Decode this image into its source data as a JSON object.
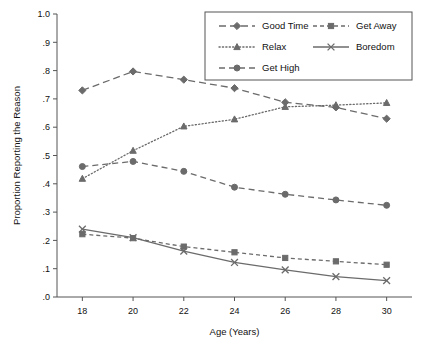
{
  "chart_data": {
    "type": "line",
    "title": "",
    "xlabel": "Age (Years)",
    "ylabel": "Proportion Reporting the Reason",
    "x": [
      18,
      20,
      22,
      24,
      26,
      28,
      30
    ],
    "xtick_labels": [
      "18",
      "20",
      "22",
      "24",
      "26",
      "28",
      "30"
    ],
    "ytick_labels": [
      "1.0",
      ".9",
      ".8",
      ".7",
      ".6",
      ".5",
      ".4",
      ".3",
      ".2",
      ".1",
      ".0"
    ],
    "ytick_values": [
      1.0,
      0.9,
      0.8,
      0.7,
      0.6,
      0.5,
      0.4,
      0.3,
      0.2,
      0.1,
      0.0
    ],
    "xlim": [
      17,
      31
    ],
    "ylim": [
      0.0,
      1.0
    ],
    "grid": false,
    "legend_position": "top-right",
    "series": [
      {
        "name": "Good Time",
        "marker": "diamond",
        "dash": "long-dash",
        "values": [
          0.73,
          0.797,
          0.768,
          0.738,
          0.688,
          0.67,
          0.63
        ]
      },
      {
        "name": "Get Away",
        "marker": "square",
        "dash": "short-dash",
        "values": [
          0.222,
          0.208,
          0.178,
          0.158,
          0.138,
          0.126,
          0.114
        ]
      },
      {
        "name": "Relax",
        "marker": "triangle",
        "dash": "dotted",
        "values": [
          0.418,
          0.517,
          0.603,
          0.628,
          0.672,
          0.678,
          0.686
        ]
      },
      {
        "name": "Boredom",
        "marker": "x",
        "dash": "solid",
        "values": [
          0.24,
          0.21,
          0.162,
          0.122,
          0.096,
          0.072,
          0.058
        ]
      },
      {
        "name": "Get High",
        "marker": "circle",
        "dash": "dash",
        "values": [
          0.461,
          0.479,
          0.444,
          0.388,
          0.363,
          0.343,
          0.324
        ]
      }
    ],
    "legend_order": [
      "Good Time",
      "Get Away",
      "Relax",
      "Boredom",
      "Get High"
    ],
    "colors": {
      "line": "#6b6b6b",
      "axis": "#555555",
      "text": "#111111",
      "background": "#ffffff"
    }
  }
}
